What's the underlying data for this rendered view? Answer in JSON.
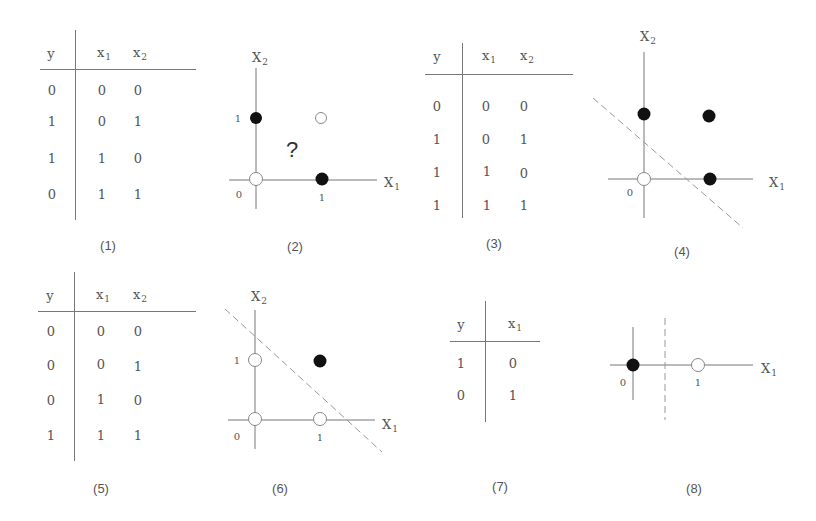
{
  "panels": [
    {
      "id": 1,
      "kind": "table",
      "caption": "(1)",
      "headers": [
        "y",
        "x1",
        "x2"
      ],
      "header_parts": [
        {
          "base": "y",
          "sub": ""
        },
        {
          "base": "x",
          "sub": "1"
        },
        {
          "base": "x",
          "sub": "2"
        }
      ],
      "rows": [
        [
          "0",
          "0",
          "0"
        ],
        [
          "1",
          "0",
          "1"
        ],
        [
          "1",
          "1",
          "0"
        ],
        [
          "0",
          "1",
          "1"
        ]
      ]
    },
    {
      "id": 2,
      "kind": "plot",
      "caption": "(2)",
      "x_label": "x1",
      "y_label": "x2",
      "tick_origin": "0",
      "tick_x": "1",
      "tick_y": "1",
      "annotation": "?",
      "points": [
        {
          "x1": 0,
          "x2": 0,
          "fill": "hollow"
        },
        {
          "x1": 0,
          "x2": 1,
          "fill": "solid"
        },
        {
          "x1": 1,
          "x2": 0,
          "fill": "solid"
        },
        {
          "x1": 1,
          "x2": 1,
          "fill": "hollow"
        }
      ],
      "separator": "none"
    },
    {
      "id": 3,
      "kind": "table",
      "caption": "(3)",
      "headers": [
        "y",
        "x1",
        "x2"
      ],
      "rows": [
        [
          "0",
          "0",
          "0"
        ],
        [
          "1",
          "0",
          "1"
        ],
        [
          "1",
          "1",
          "0"
        ],
        [
          "1",
          "1",
          "1"
        ]
      ]
    },
    {
      "id": 4,
      "kind": "plot",
      "caption": "(4)",
      "x_label": "x1",
      "y_label": "x2",
      "tick_origin": "0",
      "points": [
        {
          "x1": 0,
          "x2": 0,
          "fill": "hollow"
        },
        {
          "x1": 0,
          "x2": 1,
          "fill": "solid"
        },
        {
          "x1": 1,
          "x2": 0,
          "fill": "solid"
        },
        {
          "x1": 1,
          "x2": 1,
          "fill": "solid"
        }
      ],
      "separator": "dashed diagonal line"
    },
    {
      "id": 5,
      "kind": "table",
      "caption": "(5)",
      "headers": [
        "y",
        "x1",
        "x2"
      ],
      "rows": [
        [
          "0",
          "0",
          "0"
        ],
        [
          "0",
          "0",
          "1"
        ],
        [
          "0",
          "1",
          "0"
        ],
        [
          "1",
          "1",
          "1"
        ]
      ]
    },
    {
      "id": 6,
      "kind": "plot",
      "caption": "(6)",
      "x_label": "x1",
      "y_label": "x2",
      "tick_origin": "0",
      "tick_x": "1",
      "tick_y": "1",
      "points": [
        {
          "x1": 0,
          "x2": 0,
          "fill": "hollow"
        },
        {
          "x1": 0,
          "x2": 1,
          "fill": "hollow"
        },
        {
          "x1": 1,
          "x2": 0,
          "fill": "hollow"
        },
        {
          "x1": 1,
          "x2": 1,
          "fill": "solid"
        }
      ],
      "separator": "dashed diagonal line"
    },
    {
      "id": 7,
      "kind": "table",
      "caption": "(7)",
      "headers": [
        "y",
        "x1"
      ],
      "rows": [
        [
          "1",
          "0"
        ],
        [
          "0",
          "1"
        ]
      ]
    },
    {
      "id": 8,
      "kind": "plot",
      "caption": "(8)",
      "x_label": "x1",
      "tick_origin": "0",
      "tick_x": "1",
      "points": [
        {
          "x1": 0,
          "fill": "solid"
        },
        {
          "x1": 1,
          "fill": "hollow"
        }
      ],
      "separator": "dashed vertical line"
    }
  ],
  "labels": {
    "y": "y",
    "x": "x",
    "X": "X",
    "sub1": "1",
    "sub2": "2",
    "zero": "0",
    "one": "1",
    "question": "?"
  },
  "colors": {
    "line": "#777777",
    "text": "#555555",
    "solid_point": "#111111",
    "hollow_point": "#ffffff",
    "dashed": "#999999"
  }
}
